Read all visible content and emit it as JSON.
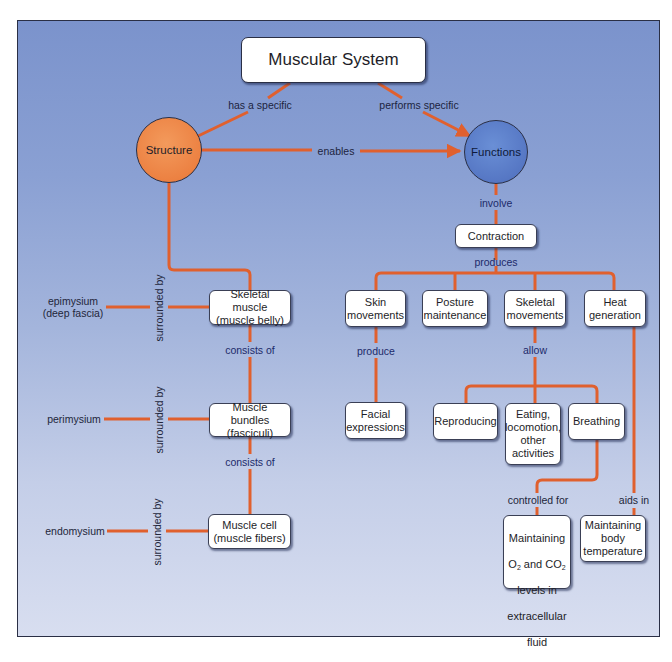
{
  "diagram": {
    "title": "Muscular System",
    "colors": {
      "background_top": "#7b93cc",
      "background_bottom": "#d8def0",
      "connector": "#e0602e",
      "structure_fill": "#ec8142",
      "functions_fill": "#5677c4",
      "node_fill": "#ffffff",
      "frame_border": "#2a2f45"
    },
    "concepts": {
      "root": "Muscular System",
      "structure": "Structure",
      "functions": "Functions",
      "contraction": "Contraction",
      "skeletal_muscle": "Skeletal muscle\n(muscle belly)",
      "muscle_bundles": "Muscle bundles\n(fasciculi)",
      "muscle_cell": "Muscle cell\n(muscle fibers)",
      "epimysium": "epimysium\n(deep fascia)",
      "perimysium": "perimysium",
      "endomysium": "endomysium",
      "skin_movements": "Skin\nmovements",
      "posture_maintenance": "Posture\nmaintenance",
      "skeletal_movements": "Skeletal\nmovements",
      "heat_generation": "Heat\ngeneration",
      "facial_expressions": "Facial\nexpressions",
      "reproducing": "Reproducing",
      "eating": "Eating,\nlocomotion,\nother\nactivities",
      "breathing": "Breathing",
      "maintaining_o2_line1": "Maintaining",
      "maintaining_o2_line2_a": "O",
      "maintaining_o2_line2_sub1": "2",
      "maintaining_o2_line2_b": " and CO",
      "maintaining_o2_line2_sub2": "2",
      "maintaining_o2_line3": "levels in",
      "maintaining_o2_line4": "extracellular",
      "maintaining_o2_line5": "fluid",
      "maintaining_body_temp": "Maintaining\nbody\ntemperature"
    },
    "links": {
      "has_a_specific": "has a specific",
      "performs_specific": "performs specific",
      "enables": "enables",
      "involve": "involve",
      "produces": "produces",
      "produce": "produce",
      "allow": "allow",
      "controlled_for": "controlled for",
      "aids_in": "aids in",
      "consists_of_1": "consists of",
      "consists_of_2": "consists of",
      "surrounded_by_1": "surrounded by",
      "surrounded_by_2": "surrounded by",
      "surrounded_by_3": "surrounded by"
    }
  }
}
